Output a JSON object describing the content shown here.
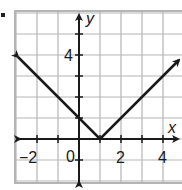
{
  "bullet": "•",
  "chart_data": {
    "type": "line",
    "title": "",
    "function": "y = |x - 1|",
    "xlabel": "x",
    "ylabel": "y",
    "xlim": [
      -3,
      5
    ],
    "ylim": [
      -2,
      6
    ],
    "grid": true,
    "grid_step": 1,
    "x_ticks_labeled": [
      -2,
      0,
      2,
      4
    ],
    "x_tick_labels": [
      "−2",
      "0",
      "2",
      "4"
    ],
    "y_ticks_labeled": [
      4
    ],
    "y_tick_labels": [
      "4"
    ],
    "series": [
      {
        "name": "y = |x − 1|",
        "x": [
          -3,
          -2,
          -1,
          0,
          1,
          2,
          3,
          4,
          5
        ],
        "y": [
          4,
          3,
          2,
          1,
          0,
          1,
          2,
          3,
          4
        ],
        "vertex": [
          1,
          0
        ],
        "arrows": [
          "left-end",
          "right-end"
        ],
        "color": "#1a1a1a"
      }
    ],
    "colors": {
      "grid": "#b5b5b5",
      "axes": "#1a1a1a",
      "curve": "#1a1a1a",
      "background": "#ffffff"
    }
  },
  "labels": {
    "x_axis": "x",
    "y_axis": "y",
    "tick_neg2": "−2",
    "tick_0": "0",
    "tick_2": "2",
    "tick_4x": "4",
    "tick_4y": "4"
  }
}
